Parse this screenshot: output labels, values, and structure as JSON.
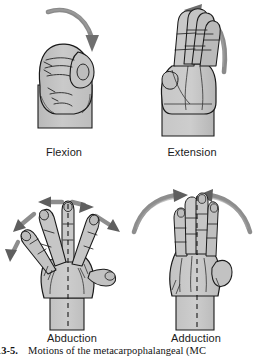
{
  "figure": {
    "caption_number": "re 13-5.",
    "caption_text": "Motions of the metacarpophalangeal (MC",
    "background_color": "#ffffff",
    "hand_fill_color": "#c8c8c8",
    "hand_outline_color": "#1a1a1a",
    "arrow_color": "#808080",
    "arrow_dark_color": "#4d4d4d",
    "axis_line_color": "#1a1a1a"
  },
  "panels": [
    {
      "id": "flexion",
      "label": "Flexion",
      "view": "lateral closed fist",
      "arrow": {
        "name": "flexion-arrow",
        "shape": "curved",
        "direction": "over-top-down-right",
        "tip": "down"
      },
      "has_axis_line": false
    },
    {
      "id": "extension",
      "label": "Extension",
      "view": "lateral open hand fingers extended",
      "arrow": {
        "name": "extension-arrow",
        "shape": "curved",
        "direction": "up-and-left",
        "tip": "left"
      },
      "has_axis_line": false
    },
    {
      "id": "abduction",
      "label": "Abduction",
      "view": "dorsal hand fingers spread",
      "arrow": {
        "name": "abduction-arrows",
        "shape": "straight-radiating",
        "direction": "outward-away-from-midline",
        "count": 4
      },
      "has_axis_line": true
    },
    {
      "id": "adduction",
      "label": "Adduction",
      "view": "dorsal hand fingers together",
      "arrow": {
        "name": "adduction-arrows",
        "shape": "curved-converging",
        "direction": "inward-toward-midline",
        "count": 2
      },
      "has_axis_line": true
    }
  ]
}
